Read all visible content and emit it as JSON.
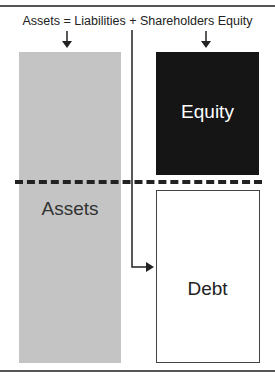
{
  "diagram": {
    "title": "Assets = Liabilities + Shareholders Equity",
    "boxes": [
      {
        "id": "assets",
        "label": "Assets",
        "color": "#c4c4c4"
      },
      {
        "id": "equity",
        "label": "Equity",
        "color": "#151515"
      },
      {
        "id": "debt",
        "label": "Debt",
        "color": "#ffffff"
      }
    ]
  }
}
